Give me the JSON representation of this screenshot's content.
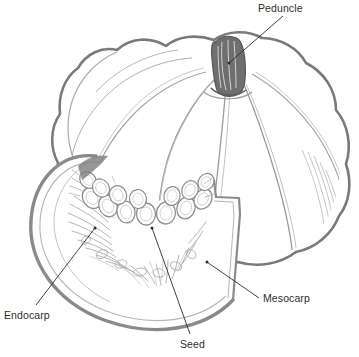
{
  "figure": {
    "style": "pencil line drawing, grayscale",
    "background_color": "#ffffff",
    "outline_color": "#7a7a7a",
    "detail_color": "#9b9b9b",
    "peduncle_fill_color": "#6f6f6f",
    "leader_color": "#2d2d2d",
    "label_color": "#2d2d2d"
  },
  "labels": [
    {
      "id": "peduncle",
      "text": "Peduncle",
      "x": 258,
      "y": 2,
      "anchor_x": 229,
      "anchor_y": 63
    },
    {
      "id": "endocarp",
      "text": "Endocarp",
      "x": 4,
      "y": 309,
      "anchor_x": 95,
      "anchor_y": 228
    },
    {
      "id": "mesocarp",
      "text": "Mesocarp",
      "x": 263,
      "y": 292,
      "anchor_x": 207,
      "anchor_y": 262
    },
    {
      "id": "seed",
      "text": "Seed",
      "x": 180,
      "y": 338,
      "anchor_x": 152,
      "anchor_y": 228
    }
  ],
  "parts": {
    "peduncle": "Peduncle",
    "endocarp": "Endocarp",
    "mesocarp": "Mesocarp",
    "seed": "Seed"
  },
  "seed_count": 14
}
